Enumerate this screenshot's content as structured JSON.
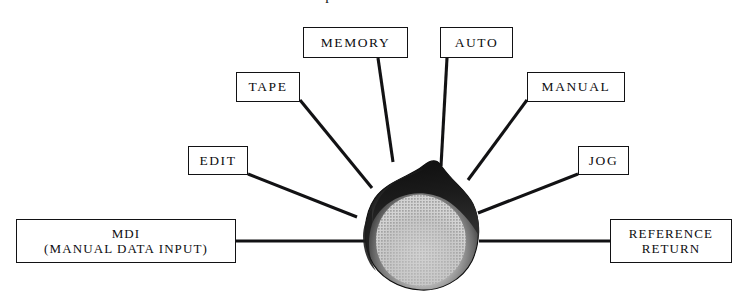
{
  "diagram": {
    "title": "Operation modes",
    "title_clipped": true,
    "canvas": {
      "width": 737,
      "height": 295,
      "background": "#ffffff"
    },
    "center_shape": {
      "name": "teardrop-blob",
      "description": "flame / teardrop shaped blob with dark outline and gray halftone fill",
      "apex": {
        "x": 440,
        "y": 163
      },
      "bounds": {
        "x": 365,
        "y": 163,
        "width": 113,
        "height": 127
      },
      "rim_color": "#1a1a1a",
      "fill_color": "#b9b9b9",
      "midtone_color": "#6e6e6e"
    },
    "nodes": [
      {
        "id": "memory",
        "lines": [
          "MEMORY"
        ],
        "box": {
          "x": 303,
          "y": 27,
          "width": 105,
          "height": 31
        },
        "text_size": "md",
        "connector": {
          "x1": 378,
          "y1": 58,
          "x2": 393,
          "y2": 162
        }
      },
      {
        "id": "auto",
        "lines": [
          "AUTO"
        ],
        "box": {
          "x": 440,
          "y": 27,
          "width": 73,
          "height": 31
        },
        "text_size": "md",
        "connector": {
          "x1": 447,
          "y1": 58,
          "x2": 441,
          "y2": 166
        }
      },
      {
        "id": "tape",
        "lines": [
          "TAPE"
        ],
        "box": {
          "x": 236,
          "y": 72,
          "width": 64,
          "height": 30
        },
        "text_size": "md",
        "connector": {
          "x1": 300,
          "y1": 100,
          "x2": 372,
          "y2": 188
        }
      },
      {
        "id": "manual",
        "lines": [
          "MANUAL"
        ],
        "box": {
          "x": 527,
          "y": 72,
          "width": 98,
          "height": 30
        },
        "text_size": "md",
        "connector": {
          "x1": 527,
          "y1": 100,
          "x2": 468,
          "y2": 180
        }
      },
      {
        "id": "edit",
        "lines": [
          "EDIT"
        ],
        "box": {
          "x": 188,
          "y": 146,
          "width": 60,
          "height": 29
        },
        "text_size": "md",
        "connector": {
          "x1": 248,
          "y1": 174,
          "x2": 357,
          "y2": 217
        }
      },
      {
        "id": "jog",
        "lines": [
          "JOG"
        ],
        "box": {
          "x": 578,
          "y": 146,
          "width": 51,
          "height": 29
        },
        "text_size": "md",
        "connector": {
          "x1": 578,
          "y1": 174,
          "x2": 478,
          "y2": 213
        }
      },
      {
        "id": "mdi",
        "lines": [
          "MDI",
          "(MANUAL DATA INPUT)"
        ],
        "box": {
          "x": 16,
          "y": 219,
          "width": 220,
          "height": 44
        },
        "text_size": "sm",
        "connector": {
          "x1": 236,
          "y1": 241,
          "x2": 366,
          "y2": 241
        }
      },
      {
        "id": "reference-return",
        "lines": [
          "REFERENCE",
          "RETURN"
        ],
        "box": {
          "x": 610,
          "y": 219,
          "width": 122,
          "height": 44
        },
        "text_size": "sm",
        "connector": {
          "x1": 610,
          "y1": 241,
          "x2": 479,
          "y2": 241
        }
      }
    ],
    "colors": {
      "ink": "#121214",
      "paper": "#ffffff",
      "blob_dark": "#1a1a1a",
      "blob_light": "#b9b9b9"
    }
  }
}
